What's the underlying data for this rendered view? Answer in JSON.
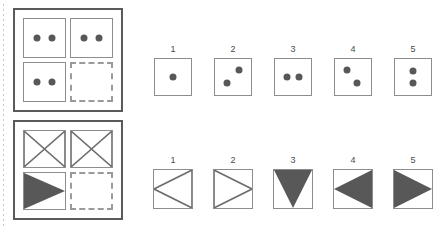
{
  "test": {
    "type": "visual-analogy-matrix",
    "puzzles": [
      {
        "id": "puzzle-1",
        "matrix": {
          "rows": 2,
          "columns": 2,
          "cells": [
            {
              "position": "top-left",
              "border": "solid",
              "content": "two-dots-horizontal"
            },
            {
              "position": "top-right",
              "border": "solid",
              "content": "two-dots-horizontal"
            },
            {
              "position": "bottom-left",
              "border": "solid",
              "content": "two-dots-horizontal"
            },
            {
              "position": "bottom-right",
              "border": "dashed",
              "content": "empty"
            }
          ]
        },
        "options": [
          {
            "number": "1",
            "content": "one-dot-center"
          },
          {
            "number": "2",
            "content": "two-dots-diagonal-up"
          },
          {
            "number": "3",
            "content": "two-dots-horizontal"
          },
          {
            "number": "4",
            "content": "two-dots-diagonal-down"
          },
          {
            "number": "5",
            "content": "two-dots-vertical"
          }
        ]
      },
      {
        "id": "puzzle-2",
        "matrix": {
          "rows": 2,
          "columns": 2,
          "cells": [
            {
              "position": "top-left",
              "border": "solid",
              "content": "bowtie-outline"
            },
            {
              "position": "top-right",
              "border": "solid",
              "content": "bowtie-outline"
            },
            {
              "position": "bottom-left",
              "border": "solid",
              "content": "triangle-right-filled"
            },
            {
              "position": "bottom-right",
              "border": "dashed",
              "content": "empty"
            }
          ]
        },
        "options": [
          {
            "number": "1",
            "content": "triangle-left-outline"
          },
          {
            "number": "2",
            "content": "triangle-right-outline"
          },
          {
            "number": "3",
            "content": "triangle-down-filled"
          },
          {
            "number": "4",
            "content": "triangle-left-filled"
          },
          {
            "number": "5",
            "content": "triangle-right-filled"
          }
        ]
      }
    ]
  },
  "colors": {
    "shape_fill": "#585858",
    "shape_stroke": "#6d6d6d",
    "cell_border": "#8d8d8d",
    "dashed_border": "#9a9a9a",
    "panel_border": "#5a5a5a",
    "number_text": "#4a4a4a",
    "background": "#ffffff"
  }
}
